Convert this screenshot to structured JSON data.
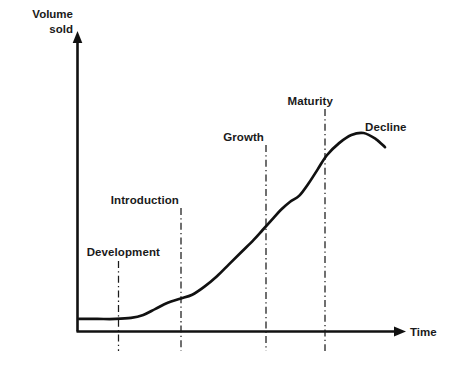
{
  "chart_data": {
    "type": "line",
    "title": "",
    "xlabel": "Time",
    "ylabel": "Volume sold",
    "ylabel_lines": [
      "Volume",
      "sold"
    ],
    "grid": false,
    "legend": "none",
    "axis_style": "arrow-axes",
    "xlim": [
      0,
      100
    ],
    "ylim": [
      0,
      100
    ],
    "series": [
      {
        "name": "Volume sold",
        "x": [
          0,
          6,
          12,
          17,
          21,
          25,
          29,
          33,
          37,
          41,
          45,
          49,
          53,
          57,
          60,
          63,
          66,
          69,
          72,
          75,
          78,
          81,
          85,
          89,
          93,
          97,
          100
        ],
        "y": [
          2,
          2,
          2,
          2.5,
          4,
          7,
          10,
          12,
          14,
          18,
          23,
          29,
          35,
          41,
          46,
          51,
          56,
          60,
          63,
          69,
          76,
          83,
          89,
          93,
          94,
          91,
          87
        ]
      }
    ],
    "stages": [
      {
        "name": "Development",
        "label": "Development",
        "boundary_x": 13,
        "label_anchor": "end",
        "description": "Pre-launch product creation phase, volume flat near zero"
      },
      {
        "name": "Introduction",
        "label": "Introduction",
        "boundary_x": 32,
        "label_anchor": "end",
        "description": "Product launched, volume begins slow rise"
      },
      {
        "name": "Growth",
        "label": "Growth",
        "boundary_x": 58,
        "label_anchor": "end",
        "description": "Rapid acceleration of volume sold"
      },
      {
        "name": "Maturity",
        "label": "Maturity",
        "boundary_x": 76,
        "label_anchor": "end",
        "description": "Volume peaks and plateaus"
      },
      {
        "name": "Decline",
        "label": "Decline",
        "boundary_x": null,
        "label_anchor": "start",
        "description": "Volume falls away after the peak"
      }
    ],
    "colors": {
      "curve": "#111111",
      "axis": "#111111",
      "divider": "#1a1a1a",
      "text": "#1a1a1a",
      "background": "#ffffff"
    }
  },
  "axes": {
    "y_title_line1": "Volume",
    "y_title_line2": "sold",
    "x_title": "Time"
  },
  "stage_labels": {
    "development": "Development",
    "introduction": "Introduction",
    "growth": "Growth",
    "maturity": "Maturity",
    "decline": "Decline"
  }
}
